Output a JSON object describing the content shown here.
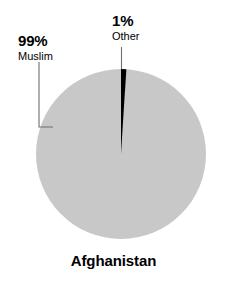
{
  "chart_data": {
    "type": "pie",
    "title": "Afghanistan",
    "xlabel": "",
    "ylabel": "",
    "categories": [
      "Muslim",
      "Other"
    ],
    "values": [
      99,
      1
    ],
    "value_labels": [
      "99%",
      "1%"
    ],
    "units": "percent",
    "legend_position": "callout-labels",
    "grid": false,
    "start_angle_deg": 0,
    "direction": "clockwise",
    "slices": [
      {
        "label": "Muslim",
        "value": 99,
        "value_label": "99%",
        "color": "#c8c8c8",
        "leader": "elbow-left"
      },
      {
        "label": "Other",
        "value": 1,
        "value_label": "1%",
        "color": "#000000",
        "leader": "vertical-top"
      }
    ]
  },
  "colors": {
    "background": "#ffffff",
    "slice_major": "#c8c8c8",
    "slice_minor": "#000000",
    "text": "#000000",
    "leader_line": "#6e6e6e"
  },
  "labels": {
    "muslim": {
      "value": "99%",
      "name": "Muslim"
    },
    "other": {
      "value": "1%",
      "name": "Other"
    }
  },
  "title": "Afghanistan"
}
